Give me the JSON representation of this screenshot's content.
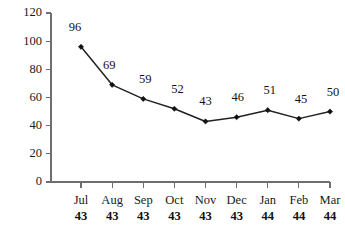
{
  "chart_data": {
    "type": "line",
    "title": "",
    "subtitle": "",
    "xlabel": "",
    "ylabel": "",
    "categories": [
      "Jul 43",
      "Aug 43",
      "Sep 43",
      "Oct 43",
      "Nov 43",
      "Dec 43",
      "Jan 44",
      "Feb 44",
      "Mar 44"
    ],
    "category_parts": [
      {
        "month": "Jul",
        "year": "43"
      },
      {
        "month": "Aug",
        "year": "43"
      },
      {
        "month": "Sep",
        "year": "43"
      },
      {
        "month": "Oct",
        "year": "43"
      },
      {
        "month": "Nov",
        "year": "43"
      },
      {
        "month": "Dec",
        "year": "43"
      },
      {
        "month": "Jan",
        "year": "44"
      },
      {
        "month": "Feb",
        "year": "44"
      },
      {
        "month": "Mar",
        "year": "44"
      }
    ],
    "values": [
      96,
      69,
      59,
      52,
      43,
      46,
      51,
      45,
      50
    ],
    "point_labels": [
      "96",
      "69",
      "59",
      "52",
      "43",
      "46",
      "51",
      "45",
      "50"
    ],
    "ylim": [
      0,
      120
    ],
    "yticks": [
      0,
      20,
      40,
      60,
      80,
      100,
      120
    ],
    "ytick_labels": [
      "0",
      "20",
      "40",
      "60",
      "80",
      "100",
      "120"
    ],
    "grid": false,
    "legend": false,
    "legend_position": "none",
    "marker": "diamond",
    "colors": {
      "background": "#ffffff",
      "line": "#222222",
      "marker": "#111111",
      "axis": "#6e6e6e",
      "text": "#1a1a1a"
    }
  }
}
